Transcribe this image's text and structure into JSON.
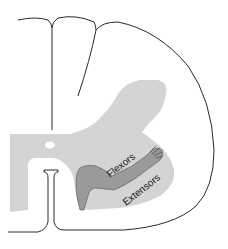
{
  "diagram": {
    "labels": {
      "flexors": "Flexors",
      "extensors": "Extensors"
    },
    "colors": {
      "background": "#ffffff",
      "outline": "#2a2a2a",
      "gray_matter": "#d4d4d4",
      "arm_fill": "#9a9a9a",
      "text": "#1a1a1a"
    }
  }
}
